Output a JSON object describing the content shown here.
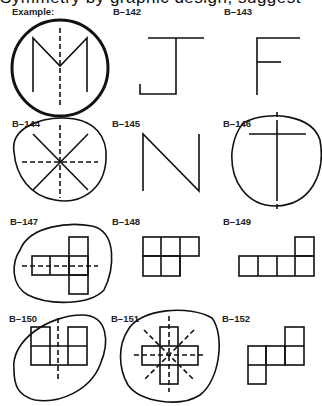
{
  "page": {
    "cut_text": "Symmetry by graphic design, suggest"
  },
  "figures": [
    {
      "id": "example",
      "label": "Example:"
    },
    {
      "id": "b142",
      "label": "B–142"
    },
    {
      "id": "b143",
      "label": "B–143"
    },
    {
      "id": "b144",
      "label": "B–144"
    },
    {
      "id": "b145",
      "label": "B–145"
    },
    {
      "id": "b146",
      "label": "B–146"
    },
    {
      "id": "b147",
      "label": "B–147"
    },
    {
      "id": "b148",
      "label": "B–148"
    },
    {
      "id": "b149",
      "label": "B–149"
    },
    {
      "id": "b150",
      "label": "B–150"
    },
    {
      "id": "b151",
      "label": "B–151"
    },
    {
      "id": "b152",
      "label": "B–152"
    }
  ]
}
